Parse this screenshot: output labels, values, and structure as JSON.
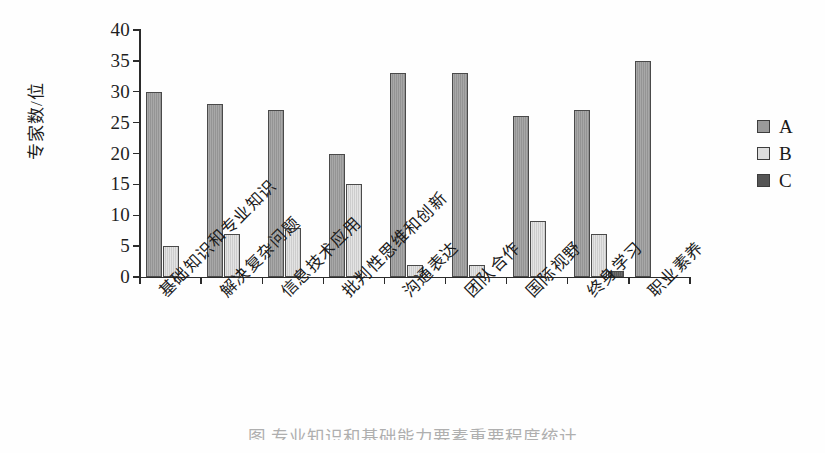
{
  "chart_data": {
    "type": "bar",
    "title": "",
    "xlabel": "",
    "ylabel": "专家数/位",
    "ylim": [
      0,
      40
    ],
    "yticks": [
      0,
      5,
      10,
      15,
      20,
      25,
      30,
      35,
      40
    ],
    "grid": false,
    "legend_position": "right",
    "categories": [
      "基础知识和专业知识",
      "解决复杂问题",
      "信息技术应用",
      "批判性思维和创新",
      "沟通表达",
      "团队合作",
      "国际视野",
      "终身学习",
      "职业素养"
    ],
    "series": [
      {
        "name": "A",
        "color": "#9a9a9a",
        "values": [
          30,
          28,
          27,
          20,
          33,
          33,
          26,
          27,
          35
        ]
      },
      {
        "name": "B",
        "color": "#d8d8d8",
        "values": [
          5,
          7,
          8,
          15,
          2,
          2,
          9,
          7,
          0
        ]
      },
      {
        "name": "C",
        "color": "#5e5e5e",
        "values": [
          0,
          0,
          0,
          0,
          0,
          0,
          0,
          1,
          0
        ]
      }
    ]
  },
  "legend": {
    "entries": [
      {
        "label": "A"
      },
      {
        "label": "B"
      },
      {
        "label": "C"
      }
    ]
  },
  "caption": {
    "text": "图   专业知识和基础能力要素重要程度统计"
  }
}
